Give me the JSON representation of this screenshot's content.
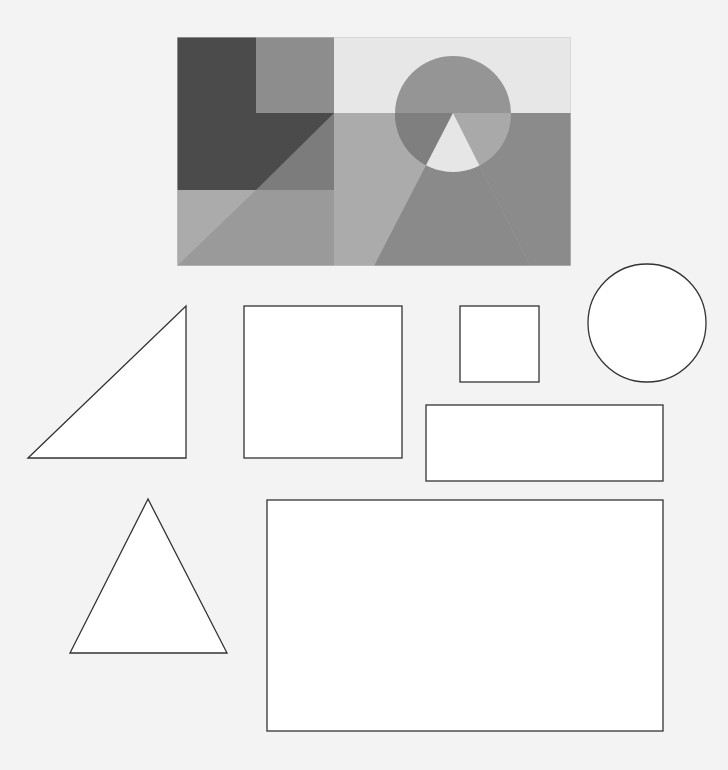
{
  "canvas": {
    "width": 728,
    "height": 770,
    "background": "#f3f3f3"
  },
  "composite": {
    "x": 177,
    "y": 37,
    "width": 394,
    "height": 229,
    "colors": {
      "dark": "#4b4b4b",
      "top_mid_block": "#8d8d8d",
      "left_mid_under_diag": "#7c7c7c",
      "left_bottom_left": "#ababab",
      "left_bottom_right": "#9a9a9a",
      "right_top": "#e7e7e7",
      "right_bottom_left": "#ababab",
      "right_bottom_right": "#8b8b8b",
      "circle_top": "#959595",
      "circle_lower_left": "#7f7f7f",
      "circle_lower_right": "#a9a9a9",
      "triangle_in_circle": "#e6e6e6",
      "triangle_below": "#8a8a8a"
    }
  },
  "outline_shapes": {
    "stroke": "#333333",
    "fill": "#ffffff",
    "right_triangle": {
      "points": "28,458 186,306 186,458"
    },
    "square_large": {
      "x": 244,
      "y": 306,
      "width": 158,
      "height": 152
    },
    "square_small": {
      "x": 460,
      "y": 306,
      "width": 79,
      "height": 76
    },
    "circle": {
      "cx": 647,
      "cy": 323,
      "r": 59
    },
    "rect_wide": {
      "x": 426,
      "y": 405,
      "width": 237,
      "height": 76
    },
    "triangle_isosceles": {
      "points": "148,499 70,653 227,653"
    },
    "rect_large": {
      "x": 267,
      "y": 500,
      "width": 396,
      "height": 231
    }
  }
}
